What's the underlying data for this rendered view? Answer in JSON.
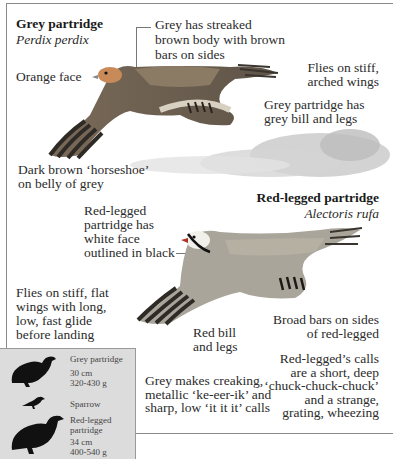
{
  "grey": {
    "title": "Grey partridge",
    "latin": "Perdix perdix",
    "labels": {
      "face": "Orange face",
      "body": "Grey has streaked\nbrown body with brown\nbars on sides",
      "flight": "Flies on stiff,\narched wings",
      "bill": "Grey partridge has\ngrey bill and legs",
      "belly": "Dark brown ‘horseshoe’\non belly of grey",
      "calls": "Grey makes creaking,\nmetallic ‘ke-eer-ik’ and\nsharp, low ‘it it it’ calls"
    }
  },
  "red": {
    "title": "Red-legged partridge",
    "latin": "Alectoris rufa",
    "labels": {
      "face": "Red-legged\npartridge has\nwhite face\noutlined in black",
      "flight": "Flies on stiff, flat\nwings with long,\nlow, fast glide\nbefore landing",
      "bill": "Red bill\nand legs",
      "bars": "Broad bars on sides\nof red-legged",
      "calls": "Red-legged’s calls\nare a short, deep\n‘chuck-chuck-chuck’\nand a strange,\ngrating, wheezing"
    }
  },
  "size_box": {
    "grey": {
      "name": "Grey partridge",
      "length": "30 cm",
      "weight": "320-430 g"
    },
    "sparrow": {
      "name": "Sparrow"
    },
    "red": {
      "name": "Red-legged\npartridge",
      "length": "34 cm",
      "weight": "400-540 g"
    }
  }
}
